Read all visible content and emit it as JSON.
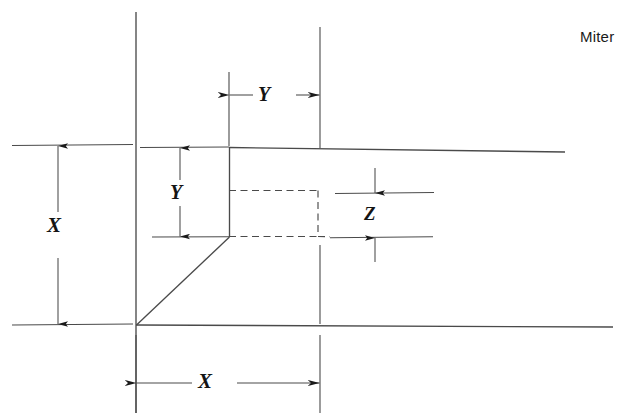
{
  "figure": {
    "kind": "engineering-dimension-diagram",
    "title_text": "Miter",
    "background_color": "#ffffff",
    "line_color": "#3c3c3c",
    "text_color": "#141414"
  },
  "caption": {
    "text": "Miter"
  },
  "dimensions": {
    "x_left": {
      "symbol": "X",
      "orientation": "vertical",
      "arrow_style": "inward-arrows",
      "from_y": 145,
      "to_y": 325
    },
    "x_bottom": {
      "symbol": "X",
      "orientation": "horizontal",
      "arrow_style": "outward-arrows",
      "from_x": 136,
      "to_x": 320
    },
    "y_vertical": {
      "symbol": "Y",
      "orientation": "vertical",
      "arrow_style": "inward-arrows",
      "from_y": 148,
      "to_y": 237
    },
    "y_horizontal": {
      "symbol": "Y",
      "orientation": "horizontal",
      "arrow_style": "outward-arrows",
      "from_x": 229,
      "to_x": 320
    },
    "z": {
      "symbol": "Z",
      "orientation": "vertical",
      "arrow_style": "outward-arrows",
      "from_y": 193,
      "to_y": 238
    }
  },
  "geometry": {
    "vertical_reference_line": "x=136, y=12 to y=413",
    "top_profile_line": "x=229,y=147 to x=565,y=152",
    "baseline": "x=136,y=325 to x=613,y=327",
    "step_riser": "x=229, y=147 to y=237",
    "miter_diagonal": "x=136,y=325 to x=229,y=237",
    "hidden_rectangle": "x 229..318, y 190..236 (dashed)"
  }
}
